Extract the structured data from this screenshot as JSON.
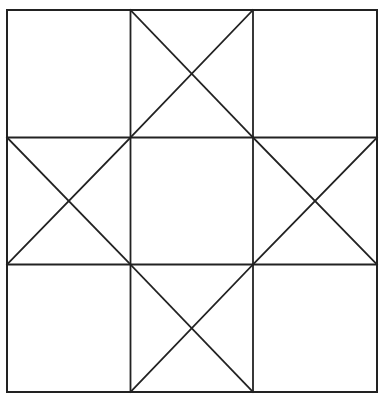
{
  "diagram": {
    "type": "quilt-block",
    "canvas": {
      "width": 382,
      "height": 401
    },
    "style": {
      "line_color": "#222222",
      "background": "#ffffff"
    },
    "outer": {
      "x1": 7,
      "y1": 10,
      "x2": 377,
      "y2": 392
    },
    "columns_x": [
      7,
      130.5,
      253,
      377
    ],
    "rows_y": [
      10,
      137.5,
      264.5,
      392
    ],
    "cells": [
      {
        "row": 0,
        "col": 0,
        "x_mark": false
      },
      {
        "row": 0,
        "col": 1,
        "x_mark": true
      },
      {
        "row": 0,
        "col": 2,
        "x_mark": false
      },
      {
        "row": 1,
        "col": 0,
        "x_mark": true
      },
      {
        "row": 1,
        "col": 1,
        "x_mark": false
      },
      {
        "row": 1,
        "col": 2,
        "x_mark": true
      },
      {
        "row": 2,
        "col": 0,
        "x_mark": false
      },
      {
        "row": 2,
        "col": 1,
        "x_mark": true
      },
      {
        "row": 2,
        "col": 2,
        "x_mark": false
      }
    ]
  }
}
